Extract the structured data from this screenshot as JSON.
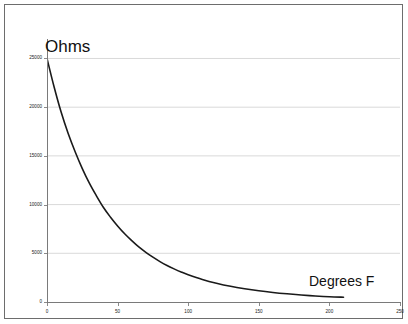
{
  "figure": {
    "background_color": "#ffffff",
    "frame_color": "#6d6d6d",
    "axis_color": "#7a7a7a",
    "grid_color": "#d9d9d9",
    "curve_color": "#1a1a1a"
  },
  "labels": {
    "y_axis_title": "Ohms",
    "x_axis_title": "Degrees F"
  },
  "chart_data": {
    "type": "line",
    "title": "",
    "subtitle": "",
    "xlabel": "Degrees F",
    "ylabel": "Ohms",
    "xlim": [
      0,
      250
    ],
    "ylim": [
      0,
      27000
    ],
    "xticks": [
      0,
      50,
      100,
      150,
      200,
      250
    ],
    "xtick_labels": [
      "0",
      "50",
      "100",
      "150",
      "200",
      "250"
    ],
    "yticks": [
      0,
      5000,
      10000,
      15000,
      20000,
      25000
    ],
    "ytick_labels": [
      "0",
      "5000",
      "10000",
      "15000",
      "20000",
      "25000"
    ],
    "grid": true,
    "grid_axis": "y",
    "legend": false,
    "legend_position": "none",
    "annotations": [],
    "series": [
      {
        "name": "Resistance vs Temperature",
        "color": "#1a1a1a",
        "line_width": 1.6,
        "x": [
          0,
          5,
          10,
          15,
          20,
          25,
          30,
          35,
          40,
          45,
          50,
          55,
          60,
          65,
          70,
          75,
          80,
          85,
          90,
          95,
          100,
          110,
          120,
          130,
          140,
          150,
          160,
          170,
          180,
          190,
          200,
          210
        ],
        "y": [
          25000,
          22100,
          19500,
          17300,
          15400,
          13700,
          12200,
          10900,
          9700,
          8700,
          7800,
          7000,
          6300,
          5650,
          5100,
          4600,
          4150,
          3750,
          3400,
          3080,
          2800,
          2320,
          1930,
          1610,
          1360,
          1150,
          980,
          840,
          720,
          620,
          540,
          490
        ]
      }
    ]
  }
}
